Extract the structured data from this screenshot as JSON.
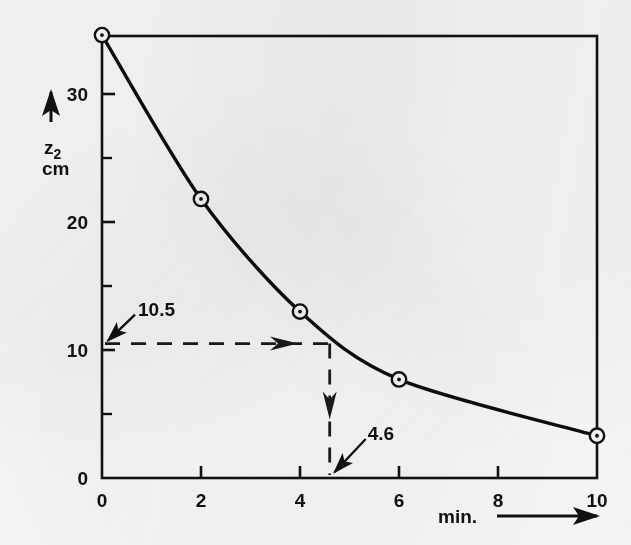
{
  "chart_data": {
    "type": "line",
    "title": "",
    "subtitle": "",
    "xlabel": "min.",
    "ylabel": "z_2",
    "ylabel_main": "z",
    "ylabel_sub": "2",
    "yunit": "cm",
    "xlim": [
      0,
      10
    ],
    "ylim": [
      0,
      34.6
    ],
    "grid": false,
    "legend": null,
    "x": [
      0,
      2,
      4,
      6,
      10
    ],
    "values": [
      34.6,
      21.8,
      13.0,
      7.7,
      3.3
    ],
    "series": [
      {
        "name": "z2",
        "x": [
          0,
          2,
          4,
          6,
          10
        ],
        "values": [
          34.6,
          21.8,
          13.0,
          7.7,
          3.3
        ],
        "marker": "circle-dot",
        "line": "solid"
      }
    ],
    "xticks": [
      0,
      2,
      4,
      6,
      8,
      10
    ],
    "xticklabels": [
      "0",
      "2",
      "4",
      "6",
      "8",
      "10"
    ],
    "yticks": [
      0,
      10,
      20,
      30
    ],
    "yticklabels": [
      "0",
      "10",
      "20",
      "30"
    ],
    "yminorticks": [
      5,
      15,
      25
    ],
    "annotations": [
      {
        "name": "y-readout",
        "label": "10.5",
        "value": 10.5,
        "axis": "y",
        "style": "dashed-line-with-arrow"
      },
      {
        "name": "x-readout",
        "label": "4.6",
        "value": 4.6,
        "axis": "x",
        "style": "dashed-line-with-arrow"
      }
    ],
    "colors": {
      "ink": "#111111",
      "paper": "#f7f6f4",
      "curve": "#0d0d0d",
      "dash": "#1a1a1a"
    }
  },
  "axis_labels": {
    "y_arrow": "up-arrow",
    "x_arrow": "right-arrow",
    "x_caption": "min.",
    "y_caption_main": "z",
    "y_caption_sub": "2",
    "y_caption_unit": "cm"
  }
}
